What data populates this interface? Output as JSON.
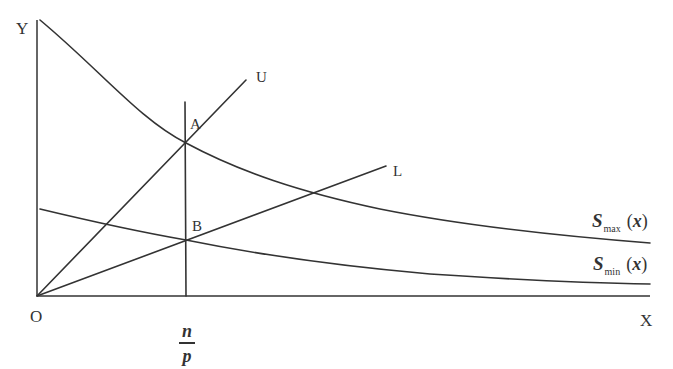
{
  "diagram": {
    "type": "economics-curve-diagram",
    "colors": {
      "line": "#333333",
      "background": "#ffffff"
    },
    "axes": {
      "origin_label": "O",
      "y_label": "Y",
      "x_label": "X"
    },
    "x_marker": {
      "numerator": "n",
      "denominator": "p"
    },
    "points": {
      "A": "A",
      "B": "B"
    },
    "lines": {
      "U": "U",
      "L": "L"
    },
    "curves": {
      "smax": {
        "symbol": "S",
        "subscript": "max",
        "arg_open": "(",
        "arg": "x",
        "arg_close": ")"
      },
      "smin": {
        "symbol": "S",
        "subscript": "min",
        "arg_open": "(",
        "arg": "x",
        "arg_close": ")"
      }
    }
  }
}
